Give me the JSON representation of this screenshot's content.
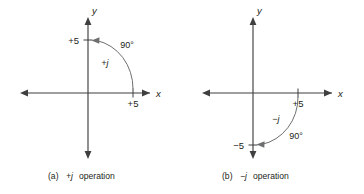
{
  "figure": {
    "background_color": "#ffffff",
    "axis_color": "#3f3f40",
    "arc_color": "#6d6e70",
    "text_color": "#231f20"
  },
  "panels": [
    {
      "id": "a",
      "caption_prefix": "(a)",
      "caption_operator": "+j",
      "caption_suffix": "operation",
      "x_axis_label": "x",
      "y_axis_label": "y",
      "x_tick_label": "+5",
      "y_tick_label": "+5",
      "operator_label": "+j",
      "angle_label": "90°",
      "rotation_direction": "counterclockwise",
      "start_point": "+5 on x-axis",
      "end_point": "+5 on y-axis"
    },
    {
      "id": "b",
      "caption_prefix": "(b)",
      "caption_operator": "−j",
      "caption_suffix": "operation",
      "x_axis_label": "x",
      "y_axis_label": "y",
      "x_tick_label": "+5",
      "y_tick_label": "−5",
      "operator_label": "−j",
      "angle_label": "90°",
      "rotation_direction": "clockwise",
      "start_point": "+5 on x-axis",
      "end_point": "−5 on y-axis"
    }
  ]
}
